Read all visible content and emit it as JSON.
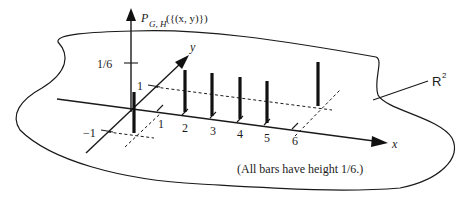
{
  "diagram": {
    "vertical_axis_label": {
      "prefix": "P",
      "subscript": "G, H",
      "argument": "({(x, y)})"
    },
    "height_tick_label": "1/6",
    "x_axis_label": "x",
    "y_axis_label": "y",
    "x_ticks": [
      "1",
      "2",
      "3",
      "4",
      "5",
      "6"
    ],
    "y_ticks": [
      "1",
      "−1"
    ],
    "plane_label": "R",
    "plane_label_superscript": "2",
    "caption": "(All bars have height 1/6.)",
    "bars": [
      {
        "x": 0,
        "y": 0,
        "height": "1/6"
      },
      {
        "x": 2,
        "y": 1,
        "height": "1/6"
      },
      {
        "x": 3,
        "y": 1,
        "height": "1/6"
      },
      {
        "x": 4,
        "y": 1,
        "height": "1/6"
      },
      {
        "x": 5,
        "y": 1,
        "height": "1/6"
      },
      {
        "x": 6,
        "y": 1,
        "height": "1/6"
      },
      {
        "x": 1,
        "y": -1,
        "height": "1/6"
      }
    ]
  }
}
